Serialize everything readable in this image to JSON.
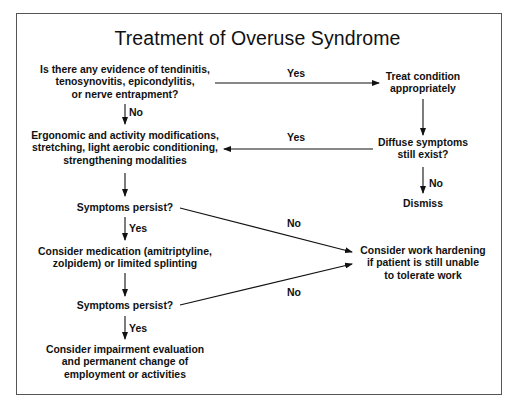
{
  "diagram": {
    "title": "Treatment of Overuse Syndrome",
    "nodes": {
      "q_evidence": "Is there any evidence of tendinitis,\ntenosynovitis, epicondylitis,\nor nerve entrapment?",
      "treat_condition": "Treat condition\nappropriately",
      "ergonomic": "Ergonomic and activity modifications,\nstretching, light aerobic conditioning,\nstrengthening modalities",
      "q_diffuse": "Diffuse symptoms\nstill exist?",
      "dismiss": "Dismiss",
      "q_persist_1": "Symptoms persist?",
      "medication": "Consider medication (amitriptyline,\nzolpidem) or limited splinting",
      "work_hardening": "Consider work hardening\nif patient is still unable\nto tolerate work",
      "q_persist_2": "Symptoms persist?",
      "impairment": "Consider impairment evaluation\nand permanent change of\nemployment or activities"
    },
    "edges": [
      {
        "from": "q_evidence",
        "to": "treat_condition",
        "label": "Yes"
      },
      {
        "from": "q_evidence",
        "to": "ergonomic",
        "label": "No"
      },
      {
        "from": "treat_condition",
        "to": "q_diffuse",
        "label": ""
      },
      {
        "from": "q_diffuse",
        "to": "ergonomic",
        "label": "Yes"
      },
      {
        "from": "q_diffuse",
        "to": "dismiss",
        "label": "No"
      },
      {
        "from": "ergonomic",
        "to": "q_persist_1",
        "label": ""
      },
      {
        "from": "q_persist_1",
        "to": "medication",
        "label": "Yes"
      },
      {
        "from": "q_persist_1",
        "to": "work_hardening",
        "label": "No"
      },
      {
        "from": "medication",
        "to": "q_persist_2",
        "label": ""
      },
      {
        "from": "q_persist_2",
        "to": "work_hardening",
        "label": "No"
      },
      {
        "from": "q_persist_2",
        "to": "impairment",
        "label": "Yes"
      }
    ],
    "labels": {
      "yes": "Yes",
      "no": "No"
    },
    "colors": {
      "ink": "#111111",
      "frame": "#555555",
      "background": "#ffffff"
    }
  }
}
